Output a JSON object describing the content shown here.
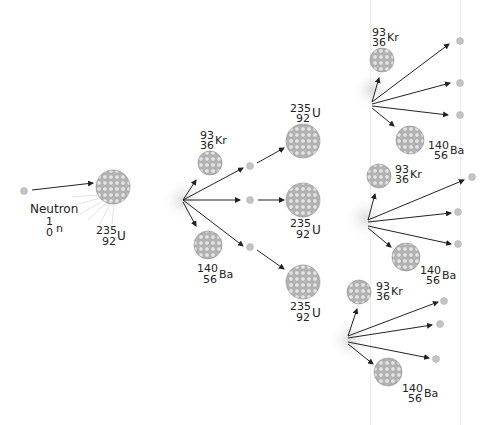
{
  "diagram": {
    "colors": {
      "nucleus_fill": "#bdbdbd",
      "nucleus_cell": "#e2e2e2",
      "nucleus_edge": "#8a8a8a",
      "neutron": "#c4c4c4",
      "arrow": "#222222",
      "flash": "#e6e6e6",
      "text": "#222222"
    },
    "labels": {
      "neutron": {
        "name": "Neutron",
        "mass": "1",
        "num": "0",
        "sym": "n"
      },
      "u235": {
        "mass": "235",
        "num": "92",
        "sym": "U"
      },
      "kr93": {
        "mass": "93",
        "num": "36",
        "sym": "Kr"
      },
      "ba140": {
        "mass": "140",
        "num": "56",
        "sym": "Ba"
      }
    },
    "generations": [
      {
        "stage": 0,
        "items": [
          "Neutron 1/0 n",
          "235/92 U"
        ]
      },
      {
        "stage": 1,
        "items": [
          "93/36 Kr",
          "140/56 Ba",
          "3 neutrons"
        ]
      },
      {
        "stage": 2,
        "items": [
          "235/92 U",
          "235/92 U",
          "235/92 U"
        ]
      },
      {
        "stage": 3,
        "items": [
          "93/36 Kr",
          "140/56 Ba",
          "3 neutrons",
          "93/36 Kr",
          "140/56 Ba",
          "3 neutrons",
          "93/36 Kr",
          "140/56 Ba",
          "3 neutrons"
        ]
      }
    ]
  }
}
